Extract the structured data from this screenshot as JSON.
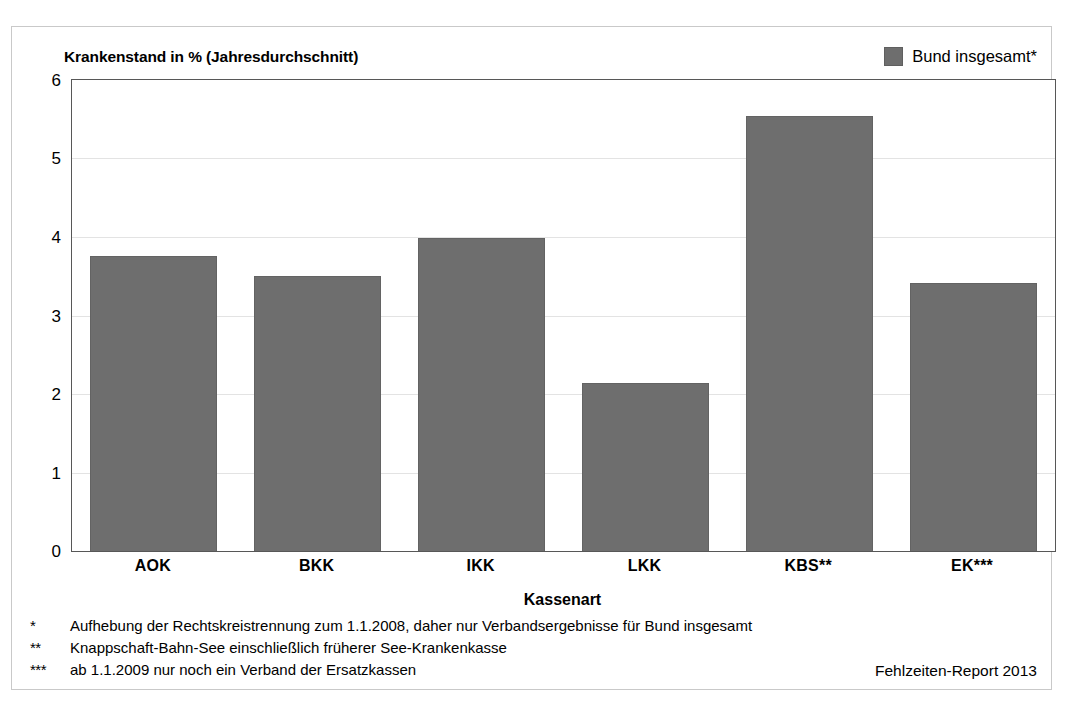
{
  "chart_data": {
    "type": "bar",
    "title": "Krankenstand in % (Jahresdurchschnitt)",
    "xlabel": "Kassenart",
    "ylabel": "",
    "categories": [
      "AOK",
      "BKK",
      "IKK",
      "LKK",
      "KBS**",
      "EK***"
    ],
    "values": [
      3.76,
      3.5,
      3.99,
      2.14,
      5.54,
      3.41
    ],
    "series": [
      {
        "name": "Bund insgesamt*",
        "values": [
          3.76,
          3.5,
          3.99,
          2.14,
          5.54,
          3.41
        ]
      }
    ],
    "ylim": [
      0,
      6
    ],
    "yticks": [
      0,
      1,
      2,
      3,
      4,
      5,
      6
    ],
    "ytick_labels": [
      "0",
      "1",
      "2",
      "3",
      "4",
      "5",
      "6"
    ],
    "grid": true,
    "grid_axis": "y",
    "legend_position": "top-right",
    "bar_color": "#6e6e6e"
  },
  "legend": {
    "entries": [
      {
        "label": "Bund insgesamt*",
        "color": "#6e6e6e"
      }
    ]
  },
  "footnotes": [
    {
      "marker": "*",
      "text": "Aufhebung der Rechtskreistrennung zum 1.1.2008, daher nur Verbandsergebnisse für Bund insgesamt"
    },
    {
      "marker": "**",
      "text": "Knappschaft-Bahn-See einschließlich früherer See-Krankenkasse"
    },
    {
      "marker": "***",
      "text": "ab 1.1.2009 nur noch ein Verband der Ersatzkassen"
    }
  ],
  "source": "Fehlzeiten-Report 2013"
}
